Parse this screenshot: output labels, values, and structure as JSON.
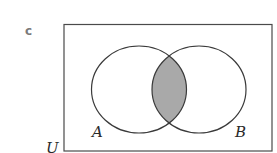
{
  "diagram": {
    "type": "venn",
    "part_label": "c",
    "universal_set_label": "U",
    "sets": [
      {
        "name": "A",
        "label": "A"
      },
      {
        "name": "B",
        "label": "B"
      }
    ],
    "shaded_region": "A ∩ B",
    "colors": {
      "stroke": "#3a3a3a",
      "shade": "#a9a9a9",
      "background": "#ffffff",
      "part_label": "#7a7a7a"
    }
  }
}
